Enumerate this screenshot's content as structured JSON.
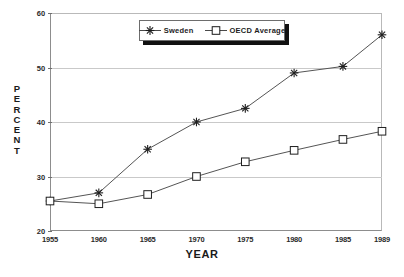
{
  "title": "",
  "axis": {
    "ylabel_letters": [
      "P",
      "E",
      "R",
      "C",
      "E",
      "N",
      "T"
    ],
    "xlabel": "YEAR"
  },
  "legend": {
    "items": [
      {
        "label": "Sweden",
        "marker": "asterisk-marker"
      },
      {
        "label": "OECD Average",
        "marker": "square-marker"
      }
    ]
  },
  "chart_data": {
    "type": "line",
    "title": "",
    "xlabel": "YEAR",
    "ylabel": "PERCENT",
    "xlim": [
      1955,
      1989
    ],
    "ylim": [
      20,
      60
    ],
    "yticks": [
      20,
      30,
      40,
      50,
      60
    ],
    "xticks": [
      1955,
      1960,
      1965,
      1970,
      1975,
      1980,
      1985,
      1989
    ],
    "x": [
      1955,
      1960,
      1965,
      1970,
      1975,
      1980,
      1985,
      1989
    ],
    "grid": "horizontal",
    "legend_position": "top-center",
    "series": [
      {
        "name": "Sweden",
        "marker": "asterisk",
        "values": [
          25.5,
          27.0,
          35.0,
          40.0,
          42.5,
          49.0,
          50.2,
          56.0
        ]
      },
      {
        "name": "OECD Average",
        "marker": "square",
        "values": [
          25.5,
          25.0,
          26.7,
          30.0,
          32.7,
          34.8,
          36.8,
          38.3
        ]
      }
    ],
    "colors": {
      "line": "#555555",
      "grid": "#c9c9c9",
      "axis": "#8d8d8d"
    }
  }
}
